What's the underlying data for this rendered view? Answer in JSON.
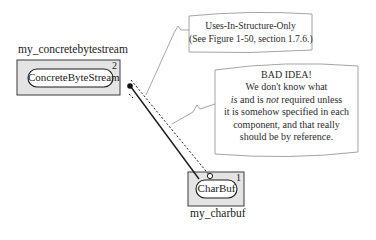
{
  "components": [
    {
      "id": "concretebytestream",
      "instance_label": "my_concretebytestream",
      "type_label": "ConcreteByteStream",
      "number": "2"
    },
    {
      "id": "charbuf",
      "instance_label": "my_charbuf",
      "type_label": "CharBuf",
      "number": "1"
    }
  ],
  "notes": [
    {
      "id": "uses-in-structure",
      "lines": [
        "Uses-In-Structure-Only",
        "(See Figure 1-50, section 1.7.6.)"
      ]
    },
    {
      "id": "bad-idea",
      "title": "BAD IDEA!",
      "line1": "We don't know what",
      "line2_italic_a": "is",
      "line2_mid": " and is ",
      "line2_italic_b": "not",
      "line2_end": " required unless",
      "line3": "it is somehow specified in each",
      "line4": "component, and that really",
      "line5": "should be by reference."
    }
  ],
  "colors": {
    "box_fill": "#e4e4e4",
    "box_stroke": "#3a3a3a",
    "note_stroke": "#9a9a9a",
    "line": "#1a1a1a"
  }
}
